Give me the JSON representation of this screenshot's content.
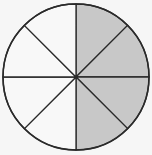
{
  "diagram": {
    "type": "fraction-circle",
    "total_sectors": 8,
    "shaded_sectors": 4,
    "shaded_side": "right half",
    "fraction_shaded": "4/8",
    "center": [
      76,
      77
    ],
    "radius": 73,
    "colors": {
      "background": "#f6f6f6",
      "unshaded_fill": "#f8f8f8",
      "shaded_fill": "#c8c8c8",
      "stroke": "#2a2a2a"
    },
    "sectors": [
      {
        "index": 0,
        "start_deg": -90,
        "end_deg": -45,
        "shaded": true
      },
      {
        "index": 1,
        "start_deg": -45,
        "end_deg": 0,
        "shaded": true
      },
      {
        "index": 2,
        "start_deg": 0,
        "end_deg": 45,
        "shaded": true
      },
      {
        "index": 3,
        "start_deg": 45,
        "end_deg": 90,
        "shaded": true
      },
      {
        "index": 4,
        "start_deg": 90,
        "end_deg": 135,
        "shaded": false
      },
      {
        "index": 5,
        "start_deg": 135,
        "end_deg": 180,
        "shaded": false
      },
      {
        "index": 6,
        "start_deg": 180,
        "end_deg": 225,
        "shaded": false
      },
      {
        "index": 7,
        "start_deg": 225,
        "end_deg": 270,
        "shaded": false
      }
    ]
  }
}
